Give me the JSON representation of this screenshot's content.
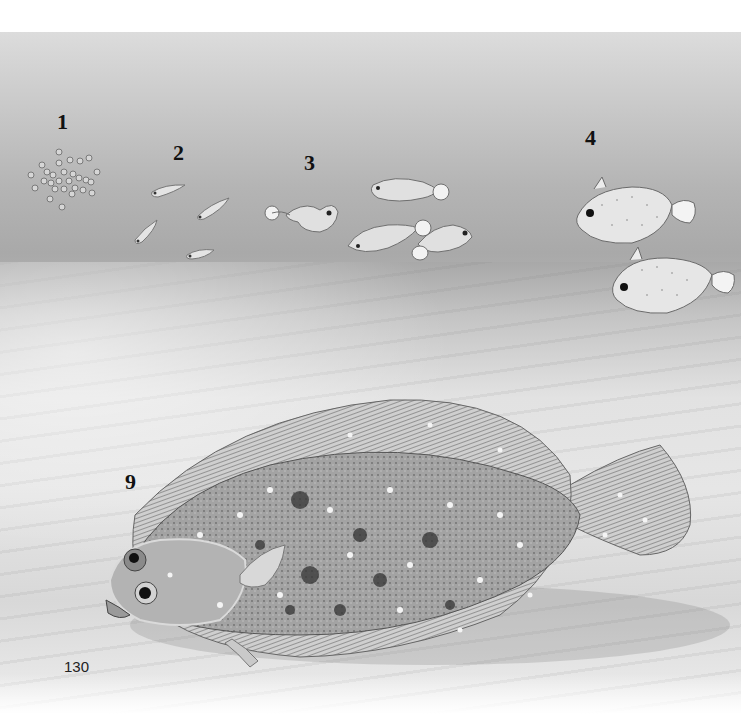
{
  "page": {
    "page_number": "130",
    "background_color": "#ffffff"
  },
  "illustration": {
    "subject": "flatfish life cycle",
    "colors": {
      "water_top": "#dcdcdc",
      "water_bottom": "#a9a9a9",
      "sand": "#e2e2e2",
      "label_text": "#111111"
    },
    "stages": [
      {
        "label": "1",
        "depicts": "eggs",
        "count": 28
      },
      {
        "label": "2",
        "depicts": "larvae",
        "count": 4
      },
      {
        "label": "3",
        "depicts": "post-larvae",
        "count": 4
      },
      {
        "label": "4",
        "depicts": "metamorphosing juveniles",
        "count": 2
      },
      {
        "label": "9",
        "depicts": "adult flounder on sea floor",
        "count": 1
      }
    ]
  }
}
